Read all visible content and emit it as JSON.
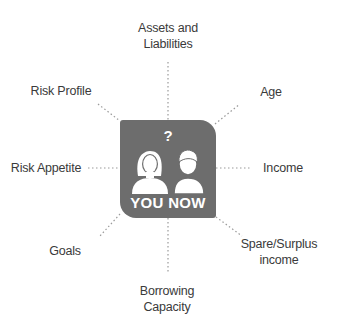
{
  "diagram": {
    "center": {
      "label": "YOU NOW",
      "question_mark": "?",
      "icon": "two-people-icon",
      "color": "#6d6d6d"
    },
    "nodes": [
      {
        "id": "assets",
        "line1": "Assets and",
        "line2": "Liabilities"
      },
      {
        "id": "age",
        "line1": "Age"
      },
      {
        "id": "income",
        "line1": "Income"
      },
      {
        "id": "surplus",
        "line1": "Spare/Surplus",
        "line2": "income"
      },
      {
        "id": "borrowing",
        "line1": "Borrowing",
        "line2": "Capacity"
      },
      {
        "id": "goals",
        "line1": "Goals"
      },
      {
        "id": "risk-appetite",
        "line1": "Risk Appetite"
      },
      {
        "id": "risk-profile",
        "line1": "Risk Profile"
      }
    ],
    "connector_style": "dotted",
    "connector_color": "#9a9a9a"
  }
}
